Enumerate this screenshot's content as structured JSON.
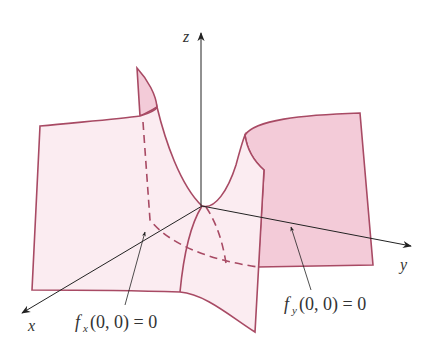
{
  "figure": {
    "axes": {
      "x_label": "x",
      "y_label": "y",
      "z_label": "z"
    },
    "annotations": [
      {
        "id": "fx",
        "func": "f",
        "sub": "x",
        "args": "(0, 0) = 0"
      },
      {
        "id": "fy",
        "func": "f",
        "sub": "y",
        "args": "(0, 0) = 0"
      }
    ],
    "colors": {
      "surface_light": "#fbecf1",
      "surface_dark": "#f3cbd8",
      "edge": "#a84a64",
      "axis": "#222222",
      "background": "#ffffff"
    }
  }
}
